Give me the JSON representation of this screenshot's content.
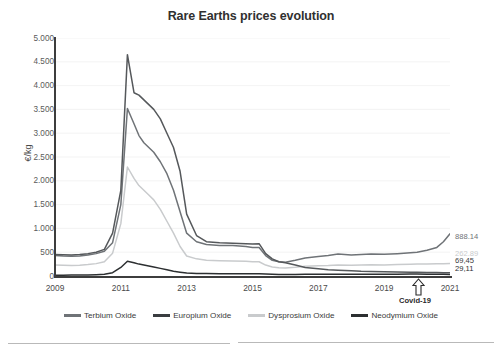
{
  "chart_data": {
    "type": "line",
    "title": "Rare Earths prices evolution",
    "xlabel": "",
    "ylabel": "€/kg",
    "ylim": [
      0,
      5000
    ],
    "xlim": [
      2009,
      2021
    ],
    "grid": true,
    "legend_position": "bottom",
    "ytick_labels": [
      "5.000",
      "4.500",
      "4.000",
      "3.500",
      "3.000",
      "2.500",
      "2.000",
      "1.500",
      "1.000",
      "500",
      "0"
    ],
    "ytick_values": [
      5000,
      4500,
      4000,
      3500,
      3000,
      2500,
      2000,
      1500,
      1000,
      500,
      0
    ],
    "xtick_labels": [
      "2009",
      "2011",
      "2013",
      "2015",
      "2017",
      "2019",
      "2021"
    ],
    "xtick_values": [
      2009,
      2011,
      2013,
      2015,
      2017,
      2019,
      2021
    ],
    "annotations": [
      {
        "label": "Covid-19",
        "x": 2020.3,
        "marker": "up-arrow"
      }
    ],
    "end_labels": [
      {
        "series": "Terbium Oxide",
        "value": "888.14",
        "color": "#6f7377"
      },
      {
        "series": "Dysprosium Oxide",
        "value": "262.89",
        "color": "#c9cbcd"
      },
      {
        "series": "Europium Oxide",
        "value": "69,45",
        "color": "#3a3d40"
      },
      {
        "series": "Neodymium Oxide",
        "value": "29,11",
        "color": "#2c2f31"
      }
    ],
    "x": [
      2009.0,
      2009.25,
      2009.5,
      2009.75,
      2010.0,
      2010.25,
      2010.5,
      2010.75,
      2011.0,
      2011.2,
      2011.4,
      2011.55,
      2011.7,
      2011.85,
      2012.0,
      2012.2,
      2012.4,
      2012.6,
      2012.8,
      2013.0,
      2013.3,
      2013.6,
      2014.0,
      2014.4,
      2014.8,
      2015.0,
      2015.2,
      2015.4,
      2015.6,
      2015.8,
      2016.0,
      2016.3,
      2016.6,
      2017.0,
      2017.3,
      2017.6,
      2018.0,
      2018.3,
      2018.6,
      2019.0,
      2019.4,
      2019.8,
      2020.0,
      2020.3,
      2020.6,
      2020.8,
      2021.0
    ],
    "series": [
      {
        "name": "Terbium Oxide",
        "color": "#6f7377",
        "values": [
          430,
          420,
          415,
          420,
          440,
          470,
          520,
          700,
          1500,
          3520,
          3200,
          2950,
          2800,
          2700,
          2600,
          2400,
          2150,
          1800,
          1350,
          900,
          720,
          660,
          640,
          640,
          620,
          600,
          600,
          430,
          330,
          300,
          290,
          330,
          380,
          410,
          430,
          460,
          440,
          450,
          460,
          455,
          470,
          490,
          500,
          540,
          600,
          720,
          888.14
        ]
      },
      {
        "name": "Europium Oxide",
        "color": "#55585b",
        "values": [
          450,
          445,
          440,
          450,
          470,
          500,
          560,
          900,
          1800,
          4650,
          3850,
          3800,
          3700,
          3600,
          3500,
          3300,
          3000,
          2700,
          2200,
          1300,
          850,
          720,
          700,
          690,
          680,
          670,
          680,
          470,
          360,
          300,
          280,
          230,
          180,
          150,
          130,
          120,
          110,
          100,
          95,
          90,
          85,
          80,
          78,
          75,
          72,
          70,
          69.45
        ]
      },
      {
        "name": "Dysprosium Oxide",
        "color": "#c9cbcd",
        "values": [
          230,
          225,
          220,
          225,
          240,
          260,
          300,
          480,
          1100,
          2290,
          2050,
          1900,
          1800,
          1700,
          1600,
          1400,
          1150,
          900,
          620,
          420,
          360,
          330,
          320,
          315,
          310,
          300,
          300,
          230,
          190,
          175,
          170,
          185,
          205,
          215,
          220,
          230,
          225,
          230,
          235,
          232,
          240,
          248,
          250,
          252,
          255,
          258,
          262.89
        ]
      },
      {
        "name": "Neodymium Oxide",
        "color": "#2c2f31",
        "values": [
          18,
          18,
          19,
          20,
          23,
          27,
          35,
          70,
          180,
          310,
          280,
          250,
          230,
          210,
          190,
          160,
          130,
          100,
          80,
          62,
          55,
          50,
          48,
          47,
          46,
          45,
          46,
          40,
          36,
          34,
          33,
          34,
          36,
          37,
          38,
          39,
          38,
          38,
          39,
          38,
          39,
          40,
          40,
          39,
          38,
          38,
          29.11
        ]
      }
    ]
  },
  "legend": {
    "items": [
      {
        "label": "Terbium Oxide",
        "color": "#6f7377"
      },
      {
        "label": "Europium Oxide",
        "color": "#3a3d40"
      },
      {
        "label": "Dysprosium Oxide",
        "color": "#c9cbcd"
      },
      {
        "label": "Neodymium Oxide",
        "color": "#2c2f31"
      }
    ]
  }
}
